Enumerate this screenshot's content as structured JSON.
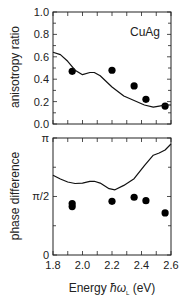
{
  "chart_data": [
    {
      "type": "scatter",
      "title": "",
      "annotation": "CuAg",
      "xlabel": "Energy ħω_L (eV)",
      "ylabel": "anisotropy ratio",
      "xlim": [
        1.8,
        2.6
      ],
      "ylim": [
        0.0,
        1.0
      ],
      "xticks": [
        1.8,
        2.0,
        2.2,
        2.4,
        2.6
      ],
      "yticks": [
        "0.0",
        "0.2",
        "0.4",
        "0.6",
        "0.8",
        "1.0"
      ],
      "series": [
        {
          "name": "experiment",
          "kind": "points",
          "x": [
            1.93,
            2.2,
            2.35,
            2.43,
            2.56
          ],
          "y": [
            0.47,
            0.48,
            0.34,
            0.22,
            0.16
          ]
        },
        {
          "name": "theory",
          "kind": "line",
          "x": [
            1.8,
            1.85,
            1.9,
            1.95,
            2.0,
            2.05,
            2.08,
            2.12,
            2.2,
            2.28,
            2.35,
            2.42,
            2.48,
            2.52,
            2.56,
            2.6
          ],
          "y": [
            0.64,
            0.62,
            0.56,
            0.48,
            0.44,
            0.46,
            0.46,
            0.43,
            0.33,
            0.25,
            0.21,
            0.17,
            0.15,
            0.16,
            0.17,
            0.17
          ]
        }
      ]
    },
    {
      "type": "scatter",
      "title": "",
      "xlabel": "Energy ħω_L (eV)",
      "ylabel": "phase difference",
      "xlim": [
        1.8,
        2.6
      ],
      "ylim": [
        0,
        3.14159
      ],
      "xticks": [
        "1.8",
        "2.0",
        "2.2",
        "2.4",
        "2.6"
      ],
      "yticks": [
        "0",
        "π/2",
        "π"
      ],
      "series": [
        {
          "name": "experiment",
          "kind": "points",
          "x": [
            1.93,
            1.93,
            2.2,
            2.35,
            2.43,
            2.56
          ],
          "y": [
            1.38,
            1.3,
            1.44,
            1.55,
            1.46,
            1.13
          ]
        },
        {
          "name": "theory",
          "kind": "line",
          "x": [
            1.8,
            1.85,
            1.9,
            1.95,
            2.0,
            2.05,
            2.08,
            2.12,
            2.18,
            2.22,
            2.28,
            2.35,
            2.42,
            2.48,
            2.52,
            2.56,
            2.6
          ],
          "y": [
            2.14,
            2.04,
            1.96,
            1.92,
            1.93,
            1.98,
            1.98,
            1.93,
            1.78,
            1.75,
            1.87,
            2.05,
            2.4,
            2.68,
            2.74,
            2.82,
            2.98
          ]
        }
      ]
    }
  ],
  "labels": {
    "top_ylabel": "anisotropy ratio",
    "bottom_ylabel": "phase difference",
    "xlabel_prefix": "Energy ",
    "xlabel_symbol": "ħω",
    "xlabel_sub": "L",
    "xlabel_suffix": " (eV)",
    "annotation": "CuAg"
  }
}
